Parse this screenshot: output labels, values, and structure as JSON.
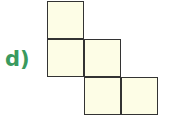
{
  "label": "d)",
  "colors": {
    "label": "#3a9a5e",
    "fill": "#fdfde6",
    "stroke": "#333333"
  },
  "squares": [
    {
      "col": 0,
      "row": 0
    },
    {
      "col": 0,
      "row": 1
    },
    {
      "col": 1,
      "row": 1
    },
    {
      "col": 1,
      "row": 2
    },
    {
      "col": 2,
      "row": 2
    }
  ]
}
